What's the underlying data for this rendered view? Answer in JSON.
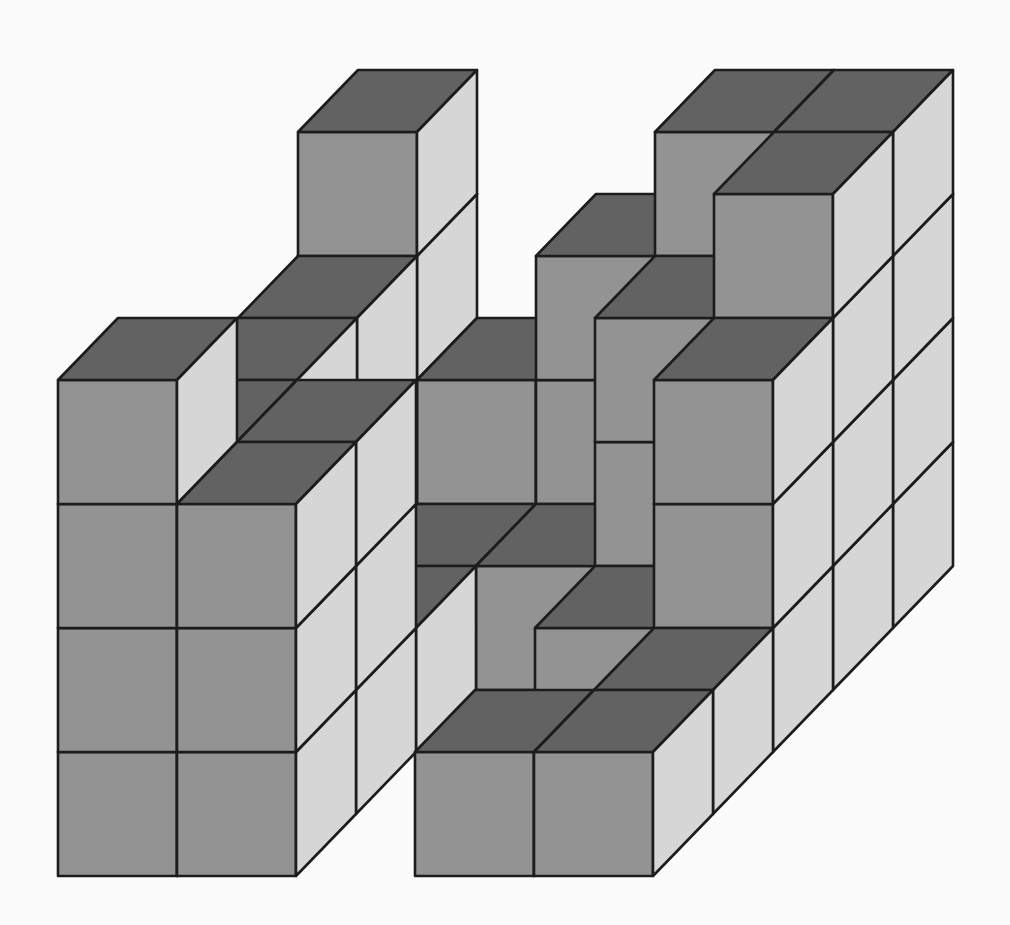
{
  "figure": {
    "type": "isometric-cube-stack",
    "description_visible": "",
    "canvas": {
      "width": 1010,
      "height": 925,
      "background": "#fbfbfb"
    },
    "projection": {
      "origin_x": 58,
      "origin_y": 876,
      "column_width": 119,
      "row_height": 124,
      "depth_dx": 60,
      "depth_dy": -62
    },
    "colors": {
      "top_face": "#626262",
      "front_face": "#939393",
      "side_face": "#d6d6d6",
      "edge": "#1c1c1c"
    },
    "edge_width": 2.6,
    "grid": {
      "columns": 5,
      "depth": 5,
      "max_height": 4
    },
    "heightmap_note": "rows = depth from front (0) to back (4); columns left (0) to right (4); value = number of stacked cubes",
    "heightmap": [
      [
        4,
        3,
        0,
        1,
        1
      ],
      [
        3,
        3,
        0,
        0,
        1
      ],
      [
        3,
        1,
        0,
        1,
        3
      ],
      [
        3,
        1,
        1,
        3,
        4
      ],
      [
        4,
        2,
        3,
        4,
        4
      ]
    ],
    "cube_count": 52
  }
}
